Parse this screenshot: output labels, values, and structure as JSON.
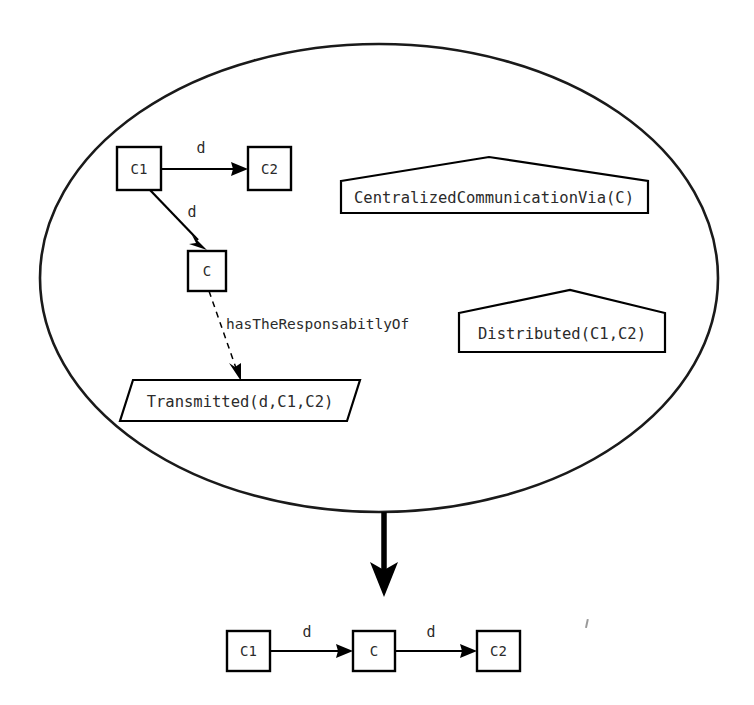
{
  "figure": {
    "kind": "transformation-diagram",
    "background_color": "#ffffff",
    "stroke_color": "#000000",
    "text_color": "#2b2b2b"
  },
  "container": {
    "shape": "ellipse",
    "name": "pattern-context-ellipse"
  },
  "source_pattern": {
    "nodes": [
      {
        "id": "c1",
        "label": "C1"
      },
      {
        "id": "c2",
        "label": "C2"
      },
      {
        "id": "c",
        "label": "C"
      }
    ],
    "edges": [
      {
        "id": "c1-to-c2",
        "label": "d",
        "from": "c1",
        "to": "c2",
        "style": "solid"
      },
      {
        "id": "c1-to-c",
        "label": "d",
        "from": "c1",
        "to": "c",
        "style": "solid"
      }
    ],
    "relations": [
      {
        "id": "responsibility",
        "label": "hasTheResponsabitlyOf",
        "style": "dashed"
      }
    ]
  },
  "predicates": [
    {
      "id": "centralized",
      "shape": "pentagon",
      "label": "CentralizedCommunicationVia(C)"
    },
    {
      "id": "distributed",
      "shape": "pentagon",
      "label": "Distributed(C1,C2)"
    },
    {
      "id": "transmitted",
      "shape": "parallelogram",
      "label": "Transmitted(d,C1,C2)"
    }
  ],
  "transform_arrow": {
    "id": "transform-arrow",
    "direction": "down",
    "style": "thick-solid"
  },
  "result_pattern": {
    "nodes": [
      {
        "id": "r-c1",
        "label": "C1"
      },
      {
        "id": "r-c",
        "label": "C"
      },
      {
        "id": "r-c2",
        "label": "C2"
      }
    ],
    "edges": [
      {
        "id": "r-c1-to-c",
        "label": "d",
        "from": "r-c1",
        "to": "r-c",
        "style": "solid"
      },
      {
        "id": "r-c-to-c2",
        "label": "d",
        "from": "r-c",
        "to": "r-c2",
        "style": "solid"
      }
    ]
  }
}
